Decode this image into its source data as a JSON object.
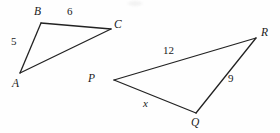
{
  "figure": {
    "stroke_color": "#222222",
    "background_color": "#fefefe",
    "stroke_width": 1.3,
    "triangles": [
      {
        "name": "triangle-abc",
        "vertices": [
          {
            "label": "A",
            "x": 20,
            "y": 73,
            "label_x": 12,
            "label_y": 78
          },
          {
            "label": "B",
            "x": 41,
            "y": 23,
            "label_x": 34,
            "label_y": 6
          },
          {
            "label": "C",
            "x": 111,
            "y": 29,
            "label_x": 114,
            "label_y": 19
          }
        ],
        "sides": [
          {
            "name": "AB",
            "label": "5",
            "label_x": 11,
            "label_y": 36
          },
          {
            "name": "BC",
            "label": "6",
            "label_x": 67,
            "label_y": 6
          },
          {
            "name": "CA",
            "label": "",
            "label_x": 0,
            "label_y": 0
          }
        ]
      },
      {
        "name": "triangle-pqr",
        "vertices": [
          {
            "label": "P",
            "x": 114,
            "y": 80,
            "label_x": 88,
            "label_y": 73
          },
          {
            "label": "Q",
            "x": 196,
            "y": 113,
            "label_x": 191,
            "label_y": 117
          },
          {
            "label": "R",
            "x": 256,
            "y": 38,
            "label_x": 261,
            "label_y": 27
          }
        ],
        "sides": [
          {
            "name": "PR",
            "label": "12",
            "label_x": 163,
            "label_y": 45
          },
          {
            "name": "QR",
            "label": "9",
            "label_x": 228,
            "label_y": 73
          },
          {
            "name": "PQ",
            "label": "x",
            "label_x": 143,
            "label_y": 98
          }
        ]
      }
    ]
  }
}
